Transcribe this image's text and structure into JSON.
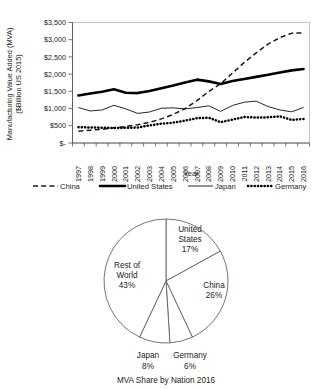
{
  "chart_data": [
    {
      "type": "line",
      "title": "",
      "xlabel": "Year",
      "ylabel": "Manufacturing Value Added (MVA)\n($Billion US 2015)",
      "ylabel_line1": "Manufacturing Value Added (MVA)",
      "ylabel_line2": "($Billion US 2015)",
      "grid": false,
      "legend_position": "bottom",
      "ylim": [
        0,
        3500
      ],
      "ytick_values": [
        0,
        500,
        1000,
        1500,
        2000,
        2500,
        3000,
        3500
      ],
      "ytick_labels": [
        "$-",
        "$500",
        "$1,000",
        "$1,500",
        "$2,000",
        "$2,500",
        "$3,000",
        "$3,500"
      ],
      "categories": [
        "1997",
        "1998",
        "1999",
        "2000",
        "2001",
        "2002",
        "2003",
        "2004",
        "2005",
        "2006",
        "2007",
        "2008",
        "2009",
        "2010",
        "2011",
        "2012",
        "2013",
        "2014",
        "2015",
        "2016"
      ],
      "series": [
        {
          "name": "China",
          "style": "dashed",
          "values": [
            340,
            370,
            400,
            440,
            480,
            530,
            600,
            700,
            830,
            1000,
            1230,
            1500,
            1720,
            2030,
            2340,
            2620,
            2870,
            3060,
            3190,
            3200
          ]
        },
        {
          "name": "United States",
          "style": "thick-solid",
          "values": [
            1380,
            1440,
            1490,
            1560,
            1460,
            1450,
            1510,
            1590,
            1670,
            1760,
            1840,
            1790,
            1715,
            1800,
            1860,
            1920,
            1980,
            2050,
            2110,
            2150
          ]
        },
        {
          "name": "Japan",
          "style": "thin-solid",
          "values": [
            1030,
            930,
            960,
            1095,
            990,
            860,
            900,
            1010,
            1020,
            990,
            1030,
            1080,
            920,
            1090,
            1185,
            1215,
            1060,
            960,
            905,
            1035
          ]
        },
        {
          "name": "Germany",
          "style": "dotted",
          "values": [
            460,
            450,
            445,
            435,
            440,
            450,
            510,
            560,
            590,
            650,
            720,
            735,
            605,
            680,
            755,
            740,
            745,
            775,
            670,
            700
          ]
        }
      ],
      "legend": [
        "China",
        "United States",
        "Japan",
        "Germany"
      ]
    },
    {
      "type": "pie",
      "title": "MVA Share by Nation 2016",
      "caption": "MVA Share by Nation 2016",
      "labels": [
        "United States",
        "China",
        "Germany",
        "Japan",
        "Rest of World"
      ],
      "values": [
        17,
        26,
        6,
        8,
        43
      ],
      "value_labels": [
        "17%",
        "26%",
        "6%",
        "8%",
        "43%"
      ],
      "slices": [
        {
          "name": "United States",
          "percent": 17,
          "label": "United States",
          "label_line1": "United",
          "label_line2": "States",
          "value_label": "17%"
        },
        {
          "name": "China",
          "percent": 26,
          "label": "China",
          "label_line1": "China",
          "label_line2": "",
          "value_label": "26%"
        },
        {
          "name": "Germany",
          "percent": 6,
          "label": "Germany",
          "label_line1": "Germany",
          "label_line2": "",
          "value_label": "6%"
        },
        {
          "name": "Japan",
          "percent": 8,
          "label": "Japan",
          "label_line1": "Japan",
          "label_line2": "",
          "value_label": "8%"
        },
        {
          "name": "Rest of World",
          "percent": 43,
          "label": "Rest of World",
          "label_line1": "Rest of",
          "label_line2": "World",
          "value_label": "43%"
        }
      ],
      "start_angle_deg": 0,
      "direction": "clockwise"
    }
  ],
  "colors": {
    "background": "#ffffff",
    "ink": "#1a1a1a",
    "axis": "#555555",
    "plot_border": "#b9b9b9",
    "pie_stroke": "#5a5a5a"
  }
}
